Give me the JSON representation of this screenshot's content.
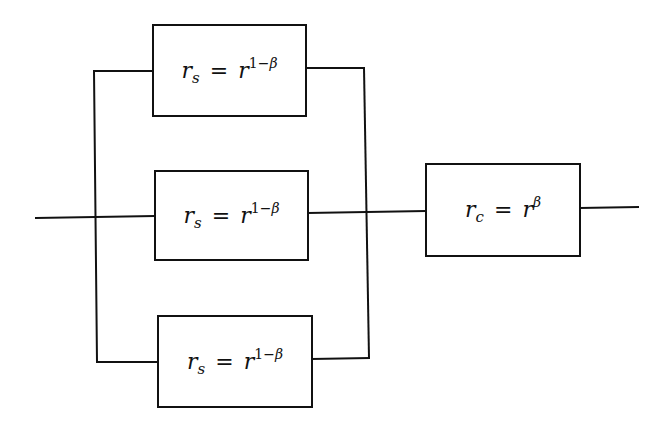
{
  "diagram": {
    "type": "reliability-block-diagram",
    "line_color": "#111111",
    "background": "#ffffff",
    "blocks": [
      {
        "id": "parallel-top",
        "var": "r",
        "sub": "s",
        "base": "r",
        "exp_prefix": "1−",
        "exp_var": "β",
        "label": "r_s = r^{1-β}"
      },
      {
        "id": "parallel-middle",
        "var": "r",
        "sub": "s",
        "base": "r",
        "exp_prefix": "1−",
        "exp_var": "β",
        "label": "r_s = r^{1-β}"
      },
      {
        "id": "parallel-bottom",
        "var": "r",
        "sub": "s",
        "base": "r",
        "exp_prefix": "1−",
        "exp_var": "β",
        "label": "r_s = r^{1-β}"
      },
      {
        "id": "series-common",
        "var": "r",
        "sub": "c",
        "base": "r",
        "exp_prefix": "",
        "exp_var": "β",
        "label": "r_c = r^{β}"
      }
    ],
    "equals": "="
  }
}
